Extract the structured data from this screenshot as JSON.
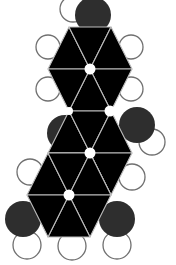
{
  "diagram": {
    "type": "space-filling molecular model (fused hexagonal rings)",
    "colors": {
      "ring_fill": "#000000",
      "ring_divider": "#bdbdbd",
      "dark_atom": "#2e2e2e",
      "light_atom_fill": "#ffffff",
      "light_atom_outline": "#707070",
      "background": "#ffffff"
    },
    "lattice": {
      "origin": [
        90,
        69
      ],
      "a": [
        42,
        0
      ],
      "b": [
        -21,
        42
      ]
    },
    "rings": [
      {
        "name": "ring-top",
        "center": [
          90,
          69
        ]
      },
      {
        "name": "ring-middle",
        "center": [
          90,
          153
        ]
      },
      {
        "name": "ring-bottom",
        "center": [
          69,
          195
        ]
      }
    ],
    "extra_hole": [
      110,
      111
    ],
    "dark_atoms": [
      {
        "name": "top",
        "cx": 93,
        "cy": 15,
        "r": 18
      },
      {
        "name": "mid-left",
        "cx": 65,
        "cy": 133,
        "r": 18
      },
      {
        "name": "mid-right",
        "cx": 137,
        "cy": 125,
        "r": 18
      },
      {
        "name": "bottom-left",
        "cx": 23,
        "cy": 219,
        "r": 18
      },
      {
        "name": "bottom-right",
        "cx": 117,
        "cy": 219,
        "r": 18
      }
    ],
    "light_atoms": [
      {
        "name": "top",
        "cx": 73,
        "cy": 9,
        "r": 13
      },
      {
        "name": "upper-left-1",
        "cx": 48,
        "cy": 47,
        "r": 12
      },
      {
        "name": "upper-left-2",
        "cx": 48,
        "cy": 89,
        "r": 12
      },
      {
        "name": "upper-right-1",
        "cx": 131,
        "cy": 47,
        "r": 12
      },
      {
        "name": "upper-right-2",
        "cx": 131,
        "cy": 89,
        "r": 12
      },
      {
        "name": "mid-right",
        "cx": 152,
        "cy": 142,
        "r": 13
      },
      {
        "name": "mid-left-lower",
        "cx": 30,
        "cy": 172,
        "r": 13
      },
      {
        "name": "mid-right-lower",
        "cx": 132,
        "cy": 177,
        "r": 13
      },
      {
        "name": "bottom-1",
        "cx": 27,
        "cy": 245,
        "r": 14
      },
      {
        "name": "bottom-2",
        "cx": 72,
        "cy": 246,
        "r": 14
      },
      {
        "name": "bottom-3",
        "cx": 117,
        "cy": 245,
        "r": 14
      }
    ]
  }
}
